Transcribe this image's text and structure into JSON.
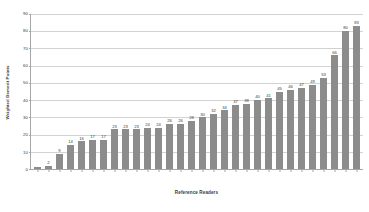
{
  "chart_data": {
    "type": "bar",
    "title": "",
    "xlabel": "Reference Readers",
    "ylabel": "Weighted Demerit Points",
    "ylim": [
      0,
      90
    ],
    "yticks": [
      0,
      10,
      20,
      30,
      40,
      50,
      60,
      70,
      80,
      90
    ],
    "grid": true,
    "legend": false,
    "bar_color": "#8c8c8c",
    "gridline_color": "#d2d2d2",
    "axis_color": "#a6a6a6",
    "text_color": "#3a3a3a",
    "categories": [
      "1",
      "2",
      "3",
      "4",
      "5",
      "6",
      "7",
      "8",
      "9",
      "10",
      "11",
      "12",
      "13",
      "14",
      "15",
      "16",
      "17",
      "18",
      "19",
      "20",
      "21",
      "22",
      "23",
      "24",
      "25",
      "26",
      "27",
      "28",
      "29",
      "30"
    ],
    "values": [
      1,
      2,
      9,
      14,
      16,
      17,
      17,
      23,
      23,
      23,
      24,
      24,
      26,
      26,
      28,
      30,
      32,
      34,
      37,
      38,
      40,
      41,
      45,
      46,
      47,
      49,
      53,
      66,
      80,
      83
    ],
    "value_labels": [
      "",
      "2",
      "9",
      "14",
      "16",
      "17",
      "17",
      "23",
      "23",
      "23",
      "24",
      "24",
      "26",
      "26",
      "28",
      "30",
      "32",
      "34",
      "37",
      "38",
      "40",
      "41",
      "45",
      "46",
      "47",
      "49",
      "53",
      "66",
      "80",
      "83"
    ]
  }
}
